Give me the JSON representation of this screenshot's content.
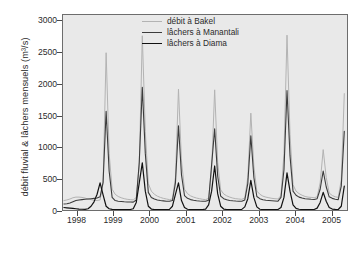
{
  "chart_data": {
    "type": "line",
    "title": "",
    "xlabel": "",
    "ylabel": "débit fluvial & lâchers mensuels (m3/s)",
    "ylabel_display": "débit fluvial & lâchers mensuels (m³/s)",
    "ylim": [
      0,
      3100
    ],
    "yticks": [
      0,
      500,
      1000,
      1500,
      2000,
      2500,
      3000
    ],
    "ytick_labels": [
      "0",
      "500",
      "1000",
      "1500",
      "2000",
      "2500",
      "3000"
    ],
    "xlim": [
      1997.6,
      2005.45
    ],
    "xticks": [
      1998,
      1999,
      2000,
      2001,
      2002,
      2003,
      2004,
      2005
    ],
    "xtick_labels": [
      "1998",
      "1999",
      "2000",
      "2001",
      "2002",
      "2003",
      "2004",
      "2005"
    ],
    "grid": false,
    "legend_position": "top-center",
    "plot_background": "#e9e9e9",
    "frame_color": "#6d6d6d",
    "x_unit": "month",
    "x_start": "1997-08",
    "series": [
      {
        "name": "débit à Bakel",
        "color": "#b3b3b3",
        "width": 1.0,
        "x": [
          1997.625,
          1997.708,
          1997.792,
          1997.875,
          1997.958,
          1998.042,
          1998.125,
          1998.208,
          1998.292,
          1998.375,
          1998.458,
          1998.542,
          1998.625,
          1998.708,
          1998.792,
          1998.875,
          1998.958,
          1999.042,
          1999.125,
          1999.208,
          1999.292,
          1999.375,
          1999.458,
          1999.542,
          1999.625,
          1999.708,
          1999.792,
          1999.875,
          1999.958,
          2000.042,
          2000.125,
          2000.208,
          2000.292,
          2000.375,
          2000.458,
          2000.542,
          2000.625,
          2000.708,
          2000.792,
          2000.875,
          2000.958,
          2001.042,
          2001.125,
          2001.208,
          2001.292,
          2001.375,
          2001.458,
          2001.542,
          2001.625,
          2001.708,
          2001.792,
          2001.875,
          2001.958,
          2002.042,
          2002.125,
          2002.208,
          2002.292,
          2002.375,
          2002.458,
          2002.542,
          2002.625,
          2002.708,
          2002.792,
          2002.875,
          2002.958,
          2003.042,
          2003.125,
          2003.208,
          2003.292,
          2003.375,
          2003.458,
          2003.542,
          2003.625,
          2003.708,
          2003.792,
          2003.875,
          2003.958,
          2004.042,
          2004.125,
          2004.208,
          2004.292,
          2004.375,
          2004.458,
          2004.542,
          2004.625,
          2004.708,
          2004.792,
          2004.875,
          2004.958,
          2005.042,
          2005.125,
          2005.208,
          2005.292,
          2005.375
        ],
        "values": [
          150,
          160,
          175,
          195,
          205,
          205,
          200,
          190,
          175,
          165,
          155,
          150,
          160,
          430,
          2500,
          900,
          330,
          250,
          215,
          195,
          180,
          170,
          165,
          160,
          200,
          700,
          2770,
          1250,
          420,
          300,
          250,
          220,
          200,
          185,
          175,
          165,
          175,
          520,
          1920,
          780,
          330,
          260,
          225,
          205,
          190,
          180,
          170,
          165,
          185,
          640,
          1910,
          760,
          320,
          255,
          225,
          205,
          190,
          180,
          175,
          170,
          190,
          520,
          1540,
          700,
          300,
          250,
          220,
          205,
          195,
          185,
          180,
          175,
          230,
          900,
          2780,
          1200,
          400,
          300,
          260,
          235,
          215,
          205,
          200,
          195,
          210,
          430,
          960,
          520,
          270,
          230,
          210,
          200,
          480,
          1850
        ]
      },
      {
        "name": "lâchers à Manantali",
        "color": "#3c3c3c",
        "width": 1.1,
        "x": [
          1997.625,
          1997.708,
          1997.792,
          1997.875,
          1997.958,
          1998.042,
          1998.125,
          1998.208,
          1998.292,
          1998.375,
          1998.458,
          1998.542,
          1998.625,
          1998.708,
          1998.792,
          1998.875,
          1998.958,
          1999.042,
          1999.125,
          1999.208,
          1999.292,
          1999.375,
          1999.458,
          1999.542,
          1999.625,
          1999.708,
          1999.792,
          1999.875,
          1999.958,
          2000.042,
          2000.125,
          2000.208,
          2000.292,
          2000.375,
          2000.458,
          2000.542,
          2000.625,
          2000.708,
          2000.792,
          2000.875,
          2000.958,
          2001.042,
          2001.125,
          2001.208,
          2001.292,
          2001.375,
          2001.458,
          2001.542,
          2001.625,
          2001.708,
          2001.792,
          2001.875,
          2001.958,
          2002.042,
          2002.125,
          2002.208,
          2002.292,
          2002.375,
          2002.458,
          2002.542,
          2002.625,
          2002.708,
          2002.792,
          2002.875,
          2002.958,
          2003.042,
          2003.125,
          2003.208,
          2003.292,
          2003.375,
          2003.458,
          2003.542,
          2003.625,
          2003.708,
          2003.792,
          2003.875,
          2003.958,
          2004.042,
          2004.125,
          2004.208,
          2004.292,
          2004.375,
          2004.458,
          2004.542,
          2004.625,
          2004.708,
          2004.792,
          2004.875,
          2004.958,
          2005.042,
          2005.125,
          2005.208,
          2005.292,
          2005.375
        ],
        "values": [
          95,
          100,
          110,
          130,
          150,
          160,
          165,
          170,
          175,
          180,
          185,
          190,
          210,
          440,
          1570,
          620,
          200,
          150,
          140,
          135,
          130,
          128,
          126,
          125,
          160,
          760,
          1950,
          900,
          280,
          200,
          175,
          160,
          150,
          145,
          140,
          138,
          150,
          430,
          1340,
          560,
          230,
          185,
          165,
          155,
          148,
          143,
          140,
          138,
          155,
          720,
          1290,
          540,
          220,
          180,
          162,
          152,
          146,
          142,
          140,
          138,
          160,
          420,
          1180,
          520,
          215,
          180,
          162,
          155,
          150,
          146,
          143,
          140,
          200,
          640,
          1900,
          860,
          300,
          235,
          205,
          190,
          180,
          175,
          170,
          168,
          180,
          330,
          620,
          370,
          210,
          185,
          172,
          165,
          380,
          1250
        ]
      },
      {
        "name": "lâchers à Diama",
        "color": "#111111",
        "width": 1.2,
        "x": [
          1997.625,
          1997.708,
          1997.792,
          1997.875,
          1997.958,
          1998.042,
          1998.125,
          1998.208,
          1998.292,
          1998.375,
          1998.458,
          1998.542,
          1998.625,
          1998.708,
          1998.792,
          1998.875,
          1998.958,
          1999.042,
          1999.125,
          1999.208,
          1999.292,
          1999.375,
          1999.458,
          1999.542,
          1999.625,
          1999.708,
          1999.792,
          1999.875,
          1999.958,
          2000.042,
          2000.125,
          2000.208,
          2000.292,
          2000.375,
          2000.458,
          2000.542,
          2000.625,
          2000.708,
          2000.792,
          2000.875,
          2000.958,
          2001.042,
          2001.125,
          2001.208,
          2001.292,
          2001.375,
          2001.458,
          2001.542,
          2001.625,
          2001.708,
          2001.792,
          2001.875,
          2001.958,
          2002.042,
          2002.125,
          2002.208,
          2002.292,
          2002.375,
          2002.458,
          2002.542,
          2002.625,
          2002.708,
          2002.792,
          2002.875,
          2002.958,
          2003.042,
          2003.125,
          2003.208,
          2003.292,
          2003.375,
          2003.458,
          2003.542,
          2003.625,
          2003.708,
          2003.792,
          2003.875,
          2003.958,
          2004.042,
          2004.125,
          2004.208,
          2004.292,
          2004.375,
          2004.458,
          2004.542,
          2004.625,
          2004.708,
          2004.792,
          2004.875,
          2004.958,
          2005.042,
          2005.125,
          2005.208,
          2005.292,
          2005.375
        ],
        "values": [
          40,
          35,
          30,
          25,
          20,
          15,
          12,
          10,
          20,
          60,
          130,
          250,
          430,
          240,
          60,
          20,
          10,
          5,
          5,
          5,
          5,
          5,
          8,
          20,
          120,
          430,
          750,
          300,
          60,
          15,
          8,
          5,
          5,
          5,
          5,
          10,
          60,
          250,
          430,
          150,
          40,
          12,
          8,
          5,
          5,
          5,
          8,
          15,
          80,
          300,
          700,
          260,
          60,
          15,
          8,
          5,
          5,
          5,
          5,
          10,
          50,
          180,
          470,
          200,
          50,
          12,
          8,
          5,
          5,
          5,
          5,
          8,
          40,
          200,
          590,
          300,
          80,
          25,
          12,
          8,
          5,
          5,
          5,
          8,
          30,
          120,
          280,
          140,
          40,
          15,
          10,
          8,
          60,
          380
        ]
      }
    ]
  }
}
